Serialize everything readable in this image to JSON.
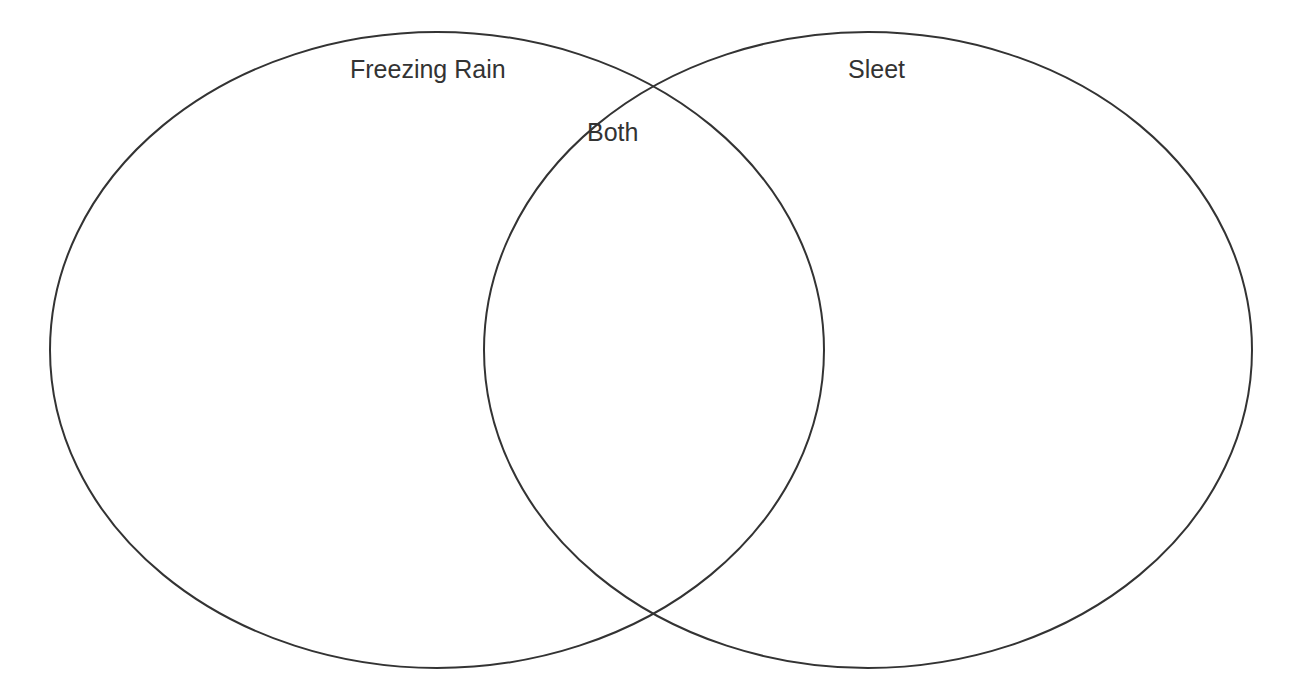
{
  "diagram": {
    "type": "venn",
    "stroke_color": "#333333",
    "background": "#ffffff",
    "sets": [
      {
        "id": "left",
        "label": "Freezing Rain"
      },
      {
        "id": "right",
        "label": "Sleet"
      }
    ],
    "intersection": {
      "label": "Both"
    }
  }
}
